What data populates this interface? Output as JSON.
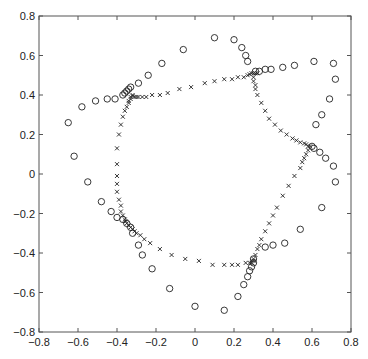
{
  "chart_data": {
    "type": "scatter",
    "title": "",
    "xlabel": "",
    "ylabel": "",
    "xlim": [
      -0.8,
      0.8
    ],
    "ylim": [
      -0.8,
      0.8
    ],
    "grid": false,
    "legend": null,
    "xticks": [
      -0.8,
      -0.6,
      -0.4,
      -0.2,
      0,
      0.2,
      0.4,
      0.6,
      0.8
    ],
    "yticks": [
      -0.8,
      -0.6,
      -0.4,
      -0.2,
      0,
      0.2,
      0.4,
      0.6,
      0.8
    ],
    "xtick_labels": [
      "−0.8",
      "−0.6",
      "−0.4",
      "−0.2",
      "0",
      "0.2",
      "0.4",
      "0.6",
      "0.8"
    ],
    "ytick_labels": [
      "−0.8",
      "−0.6",
      "−0.4",
      "−0.2",
      "0",
      "0.2",
      "0.4",
      "0.6",
      "0.8"
    ],
    "series": [
      {
        "name": "circles",
        "marker": "o",
        "color": "#222222",
        "points": [
          [
            -0.65,
            0.26
          ],
          [
            -0.62,
            0.09
          ],
          [
            -0.58,
            0.34
          ],
          [
            -0.51,
            0.37
          ],
          [
            -0.45,
            0.38
          ],
          [
            -0.41,
            0.38
          ],
          [
            -0.37,
            0.4
          ],
          [
            -0.36,
            0.41
          ],
          [
            -0.35,
            0.42
          ],
          [
            -0.34,
            0.43
          ],
          [
            -0.33,
            0.44
          ],
          [
            -0.29,
            0.46
          ],
          [
            -0.24,
            0.5
          ],
          [
            -0.17,
            0.56
          ],
          [
            -0.06,
            0.63
          ],
          [
            0.1,
            0.69
          ],
          [
            0.2,
            0.68
          ],
          [
            0.24,
            0.64
          ],
          [
            0.26,
            0.6
          ],
          [
            0.27,
            0.57
          ],
          [
            0.31,
            0.52
          ],
          [
            0.33,
            0.52
          ],
          [
            0.36,
            0.53
          ],
          [
            0.39,
            0.53
          ],
          [
            0.45,
            0.54
          ],
          [
            0.51,
            0.55
          ],
          [
            0.61,
            0.57
          ],
          [
            0.71,
            0.56
          ],
          [
            0.72,
            0.48
          ],
          [
            0.69,
            0.38
          ],
          [
            0.65,
            0.3
          ],
          [
            0.62,
            0.25
          ],
          [
            0.6,
            0.14
          ],
          [
            0.61,
            0.13
          ],
          [
            0.64,
            0.11
          ],
          [
            0.67,
            0.08
          ],
          [
            0.71,
            0.04
          ],
          [
            0.72,
            -0.04
          ],
          [
            0.65,
            -0.17
          ],
          [
            0.54,
            -0.28
          ],
          [
            0.46,
            -0.35
          ],
          [
            0.4,
            -0.36
          ],
          [
            0.36,
            -0.37
          ],
          [
            0.3,
            -0.43
          ],
          [
            0.3,
            -0.45
          ],
          [
            0.29,
            -0.47
          ],
          [
            0.28,
            -0.49
          ],
          [
            0.27,
            -0.52
          ],
          [
            0.25,
            -0.56
          ],
          [
            0.22,
            -0.62
          ],
          [
            0.15,
            -0.69
          ],
          [
            0.0,
            -0.67
          ],
          [
            -0.13,
            -0.58
          ],
          [
            -0.22,
            -0.48
          ],
          [
            -0.27,
            -0.41
          ],
          [
            -0.29,
            -0.36
          ],
          [
            -0.32,
            -0.3
          ],
          [
            -0.33,
            -0.27
          ],
          [
            -0.35,
            -0.25
          ],
          [
            -0.37,
            -0.23
          ],
          [
            -0.4,
            -0.22
          ],
          [
            -0.43,
            -0.19
          ],
          [
            -0.48,
            -0.14
          ],
          [
            -0.55,
            -0.04
          ]
        ]
      },
      {
        "name": "crosses",
        "marker": "x",
        "color": "#222222",
        "points": [
          [
            -0.4,
            -0.01
          ],
          [
            -0.4,
            0.05
          ],
          [
            -0.4,
            0.13
          ],
          [
            -0.39,
            0.2
          ],
          [
            -0.38,
            0.25
          ],
          [
            -0.37,
            0.29
          ],
          [
            -0.36,
            0.32
          ],
          [
            -0.35,
            0.34
          ],
          [
            -0.34,
            0.36
          ],
          [
            -0.34,
            0.37
          ],
          [
            -0.33,
            0.38
          ],
          [
            -0.33,
            0.39
          ],
          [
            -0.32,
            0.395
          ],
          [
            -0.32,
            0.4
          ],
          [
            -0.31,
            0.39
          ],
          [
            -0.3,
            0.39
          ],
          [
            -0.29,
            0.39
          ],
          [
            -0.27,
            0.39
          ],
          [
            -0.25,
            0.39
          ],
          [
            -0.22,
            0.4
          ],
          [
            -0.18,
            0.4
          ],
          [
            -0.14,
            0.41
          ],
          [
            -0.08,
            0.43
          ],
          [
            -0.02,
            0.44
          ],
          [
            0.05,
            0.46
          ],
          [
            0.1,
            0.47
          ],
          [
            0.15,
            0.48
          ],
          [
            0.19,
            0.48
          ],
          [
            0.22,
            0.49
          ],
          [
            0.25,
            0.49
          ],
          [
            0.27,
            0.5
          ],
          [
            0.28,
            0.505
          ],
          [
            0.29,
            0.51
          ],
          [
            0.3,
            0.51
          ],
          [
            0.31,
            0.51
          ],
          [
            0.32,
            0.51
          ],
          [
            0.3,
            0.49
          ],
          [
            0.3,
            0.47
          ],
          [
            0.31,
            0.45
          ],
          [
            0.31,
            0.43
          ],
          [
            0.32,
            0.4
          ],
          [
            0.34,
            0.36
          ],
          [
            0.36,
            0.32
          ],
          [
            0.38,
            0.28
          ],
          [
            0.41,
            0.25
          ],
          [
            0.44,
            0.22
          ],
          [
            0.47,
            0.2
          ],
          [
            0.5,
            0.18
          ],
          [
            0.52,
            0.17
          ],
          [
            0.54,
            0.16
          ],
          [
            0.56,
            0.155
          ],
          [
            0.57,
            0.15
          ],
          [
            0.58,
            0.14
          ],
          [
            0.59,
            0.14
          ],
          [
            0.58,
            0.12
          ],
          [
            0.57,
            0.1
          ],
          [
            0.56,
            0.08
          ],
          [
            0.55,
            0.06
          ],
          [
            0.54,
            0.03
          ],
          [
            0.51,
            -0.01
          ],
          [
            0.48,
            -0.06
          ],
          [
            0.45,
            -0.11
          ],
          [
            0.42,
            -0.17
          ],
          [
            0.4,
            -0.21
          ],
          [
            0.38,
            -0.25
          ],
          [
            0.36,
            -0.29
          ],
          [
            0.34,
            -0.33
          ],
          [
            0.33,
            -0.36
          ],
          [
            0.32,
            -0.38
          ],
          [
            0.31,
            -0.41
          ],
          [
            0.3,
            -0.43
          ],
          [
            0.3,
            -0.44
          ],
          [
            0.29,
            -0.45
          ],
          [
            0.28,
            -0.45
          ],
          [
            0.26,
            -0.45
          ],
          [
            0.22,
            -0.46
          ],
          [
            0.19,
            -0.46
          ],
          [
            0.15,
            -0.46
          ],
          [
            0.09,
            -0.46
          ],
          [
            0.02,
            -0.44
          ],
          [
            -0.05,
            -0.43
          ],
          [
            -0.12,
            -0.41
          ],
          [
            -0.18,
            -0.38
          ],
          [
            -0.23,
            -0.35
          ],
          [
            -0.26,
            -0.33
          ],
          [
            -0.28,
            -0.31
          ],
          [
            -0.3,
            -0.3
          ],
          [
            -0.31,
            -0.29
          ],
          [
            -0.32,
            -0.28
          ],
          [
            -0.33,
            -0.27
          ],
          [
            -0.34,
            -0.26
          ],
          [
            -0.35,
            -0.25
          ],
          [
            -0.355,
            -0.24
          ],
          [
            -0.36,
            -0.23
          ],
          [
            -0.37,
            -0.21
          ],
          [
            -0.38,
            -0.19
          ],
          [
            -0.38,
            -0.16
          ],
          [
            -0.39,
            -0.13
          ],
          [
            -0.4,
            -0.09
          ],
          [
            -0.4,
            -0.05
          ]
        ]
      }
    ]
  },
  "plot_area": {
    "left": 39,
    "top": 16,
    "right": 351,
    "bottom": 332
  },
  "colors": {
    "axis": "#555555",
    "marker": "#222222",
    "background": "#ffffff"
  }
}
